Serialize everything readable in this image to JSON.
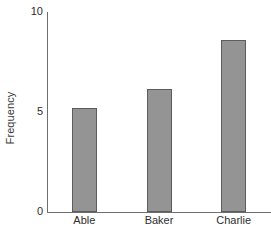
{
  "chart_data": {
    "type": "bar",
    "title": "",
    "xlabel": "",
    "ylabel": "Frequency",
    "categories": [
      "Able",
      "Baker",
      "Charlie"
    ],
    "values": [
      5.2,
      6.15,
      8.6
    ],
    "ylim": [
      0,
      10
    ],
    "yticks": [
      0,
      5,
      10
    ],
    "ytick_labels": [
      "0",
      "5",
      "10"
    ],
    "grid": false,
    "legend": "none",
    "bar_color": "#949494",
    "bar_edge_color": "#5c5c5c",
    "axis_color": "#6e6e6e",
    "background": "#ffffff"
  }
}
